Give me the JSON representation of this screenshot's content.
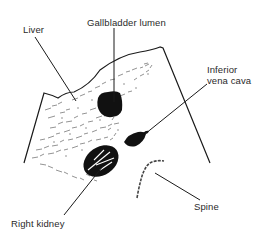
{
  "figure": {
    "type": "anatomical-ultrasound-diagram",
    "view": "transverse upper abdomen"
  },
  "labels": {
    "liver": "Liver",
    "gallbladder": "Gallbladder lumen",
    "ivc_line1": "Inferior",
    "ivc_line2": "vena cava",
    "kidney": "Right kidney",
    "spine": "Spine"
  },
  "colors": {
    "ink": "#1a1a1a",
    "text": "#2a2a2a",
    "background": "#ffffff"
  }
}
